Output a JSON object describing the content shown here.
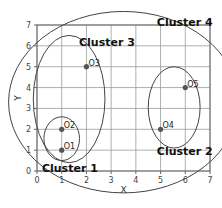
{
  "chart_data": {
    "type": "scatter",
    "title": "",
    "xlabel": "X",
    "ylabel": "Y",
    "xlim": [
      0,
      7
    ],
    "ylim": [
      0,
      7
    ],
    "xticks": [
      0,
      1,
      2,
      3,
      4,
      5,
      6,
      7
    ],
    "yticks": [
      0,
      1,
      2,
      3,
      4,
      5,
      6,
      7
    ],
    "grid": true,
    "points": [
      {
        "label": "O1",
        "x": 1,
        "y": 1
      },
      {
        "label": "O2",
        "x": 1,
        "y": 2
      },
      {
        "label": "O3",
        "x": 2,
        "y": 5
      },
      {
        "label": "O4",
        "x": 5,
        "y": 2
      },
      {
        "label": "O5",
        "x": 6,
        "y": 4
      }
    ],
    "clusters": [
      {
        "name": "Cluster 1",
        "members": [
          "O1",
          "O2"
        ],
        "cx": 1.0,
        "cy": 1.55,
        "rx": 0.72,
        "ry": 1.05,
        "label_x": 0.2,
        "label_y": 0.15
      },
      {
        "name": "Cluster 2",
        "members": [
          "O4",
          "O5"
        ],
        "cx": 5.55,
        "cy": 3.05,
        "rx": 1.05,
        "ry": 1.95,
        "label_x": 4.85,
        "label_y": 0.95
      },
      {
        "name": "Cluster 3",
        "members": [
          "O1",
          "O2",
          "O3"
        ],
        "cx": 1.3,
        "cy": 3.45,
        "rx": 1.45,
        "ry": 3.05,
        "label_x": 1.7,
        "label_y": 6.2
      },
      {
        "name": "Cluster 4",
        "members": [
          "O1",
          "O2",
          "O3",
          "O4",
          "O5"
        ],
        "cx": 3.5,
        "cy": 3.3,
        "rx": 4.65,
        "ry": 4.35,
        "label_x": 4.85,
        "label_y": 7.15
      }
    ]
  },
  "axes": {
    "x_label": "X",
    "y_label": "Y",
    "x_ticks": [
      "0",
      "1",
      "2",
      "3",
      "4",
      "5",
      "6",
      "7"
    ],
    "y_ticks": [
      "0",
      "1",
      "2",
      "3",
      "4",
      "5",
      "6",
      "7"
    ]
  },
  "points": [
    {
      "label": "O1"
    },
    {
      "label": "O2"
    },
    {
      "label": "O3"
    },
    {
      "label": "O4"
    },
    {
      "label": "O5"
    }
  ],
  "clusters": [
    {
      "label": "Cluster 1"
    },
    {
      "label": "Cluster 2"
    },
    {
      "label": "Cluster 3"
    },
    {
      "label": "Cluster 4"
    }
  ],
  "colors": {
    "point": "#555555",
    "outline": "#444444",
    "grid": "#9a9a9a"
  }
}
